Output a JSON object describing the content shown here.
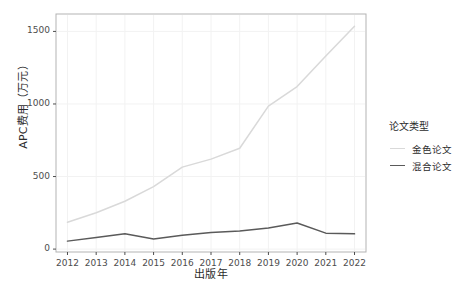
{
  "chart_data": {
    "type": "line",
    "title": "",
    "xlabel": "出版年",
    "ylabel": "APC费用（万元）",
    "x": [
      2012,
      2013,
      2014,
      2015,
      2016,
      2017,
      2018,
      2019,
      2020,
      2021,
      2022
    ],
    "xtick_labels": [
      "2012",
      "2013",
      "2014",
      "2015",
      "2016",
      "2017",
      "2018",
      "2019",
      "2020",
      "2021",
      "2022"
    ],
    "ytick_labels": [
      "0",
      "500",
      "1000",
      "1500"
    ],
    "yticks": [
      0,
      500,
      1000,
      1500
    ],
    "ylim": [
      -20,
      1620
    ],
    "xlim": [
      2011.6,
      2022.4
    ],
    "grid": true,
    "legend_title": "论文类型",
    "legend_position": "right",
    "series": [
      {
        "name": "金色论文",
        "color": "#d9d9d9",
        "values": [
          185,
          250,
          330,
          430,
          565,
          620,
          695,
          985,
          1120,
          1330,
          1535
        ]
      },
      {
        "name": "混合论文",
        "color": "#5a5a5a",
        "values": [
          55,
          80,
          105,
          70,
          95,
          115,
          125,
          145,
          180,
          110,
          105
        ]
      }
    ]
  },
  "panel": {
    "background": "#ffffff",
    "border_color": "#b3b3b3",
    "grid_color": "#f2f2f2"
  }
}
